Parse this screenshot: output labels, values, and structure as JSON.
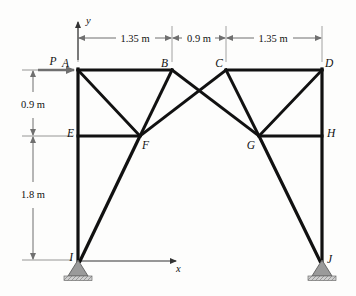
{
  "figure": {
    "type": "statics-truss-frame-diagram",
    "colors": {
      "member": "#111111",
      "dimension": "#6f6f6f",
      "support_fill": "#9a9a9a",
      "background": "#fdfdfc"
    }
  },
  "axes": {
    "x_label": "x",
    "y_label": "y",
    "origin_node": "I"
  },
  "load": {
    "label": "P",
    "applied_at": "A",
    "direction": "rightward-horizontal"
  },
  "nodes": [
    {
      "id": "A",
      "label": "A",
      "x": 78,
      "y": 70,
      "label_dx": -9,
      "label_dy": -3
    },
    {
      "id": "B",
      "label": "B",
      "x": 172,
      "y": 70,
      "label_dx": -4,
      "label_dy": -3
    },
    {
      "id": "C",
      "label": "C",
      "x": 226,
      "y": 70,
      "label_dx": -3,
      "label_dy": -3
    },
    {
      "id": "D",
      "label": "D",
      "x": 322,
      "y": 70,
      "label_dx": 3,
      "label_dy": -3
    },
    {
      "id": "E",
      "label": "E",
      "x": 78,
      "y": 136,
      "label_dx": -12,
      "label_dy": 1
    },
    {
      "id": "F",
      "label": "F",
      "x": 140,
      "y": 136,
      "label_dx": 2,
      "label_dy": 13
    },
    {
      "id": "G",
      "label": "G",
      "x": 259,
      "y": 136,
      "label_dx": -12,
      "label_dy": 13
    },
    {
      "id": "H",
      "label": "H",
      "x": 322,
      "y": 136,
      "label_dx": 5,
      "label_dy": 1
    },
    {
      "id": "I",
      "label": "I",
      "x": 78,
      "y": 260,
      "label_dx": -9,
      "label_dy": 0
    },
    {
      "id": "J",
      "label": "J",
      "x": 322,
      "y": 260,
      "label_dx": 5,
      "label_dy": 2
    }
  ],
  "members": [
    {
      "from": "A",
      "to": "B",
      "kind": "chord"
    },
    {
      "from": "B",
      "to": "C",
      "kind": "chord-gap"
    },
    {
      "from": "C",
      "to": "D",
      "kind": "chord"
    },
    {
      "from": "A",
      "to": "E",
      "kind": "column"
    },
    {
      "from": "E",
      "to": "I",
      "kind": "column"
    },
    {
      "from": "D",
      "to": "H",
      "kind": "column"
    },
    {
      "from": "H",
      "to": "J",
      "kind": "column"
    },
    {
      "from": "E",
      "to": "F",
      "kind": "horizontal"
    },
    {
      "from": "G",
      "to": "H",
      "kind": "horizontal"
    },
    {
      "from": "A",
      "to": "F",
      "kind": "diagonal"
    },
    {
      "from": "B",
      "to": "F",
      "kind": "diagonal"
    },
    {
      "from": "C",
      "to": "G",
      "kind": "diagonal"
    },
    {
      "from": "D",
      "to": "G",
      "kind": "diagonal"
    },
    {
      "from": "B",
      "to": "G",
      "kind": "long-diagonal"
    },
    {
      "from": "C",
      "to": "F",
      "kind": "long-diagonal"
    },
    {
      "from": "F",
      "to": "I",
      "kind": "brace"
    },
    {
      "from": "G",
      "to": "J",
      "kind": "brace"
    }
  ],
  "dimensions": {
    "horizontal": [
      {
        "id": "dim-ab",
        "text": "1.35 m",
        "from_x": 78,
        "to_x": 172,
        "y": 38
      },
      {
        "id": "dim-bc",
        "text": "0.9 m",
        "from_x": 172,
        "to_x": 226,
        "y": 38
      },
      {
        "id": "dim-cd",
        "text": "1.35 m",
        "from_x": 226,
        "to_x": 322,
        "y": 38
      }
    ],
    "vertical": [
      {
        "id": "dim-ae",
        "text": "0.9 m",
        "x": 33,
        "from_y": 70,
        "to_y": 136
      },
      {
        "id": "dim-ei",
        "text": "1.8 m",
        "x": 33,
        "from_y": 136,
        "to_y": 260
      }
    ]
  },
  "supports": [
    {
      "id": "support-i",
      "at": "I",
      "type": "pin"
    },
    {
      "id": "support-j",
      "at": "J",
      "type": "pin"
    }
  ]
}
